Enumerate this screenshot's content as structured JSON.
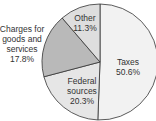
{
  "chart_data": {
    "type": "pie",
    "title": "",
    "categories": [
      "Taxes",
      "Federal sources",
      "Charges for goods and services",
      "Other"
    ],
    "values": [
      50.6,
      20.3,
      17.8,
      11.3
    ],
    "unit": "%",
    "colors": [
      "#f2f2f2",
      "#e6e6e6",
      "#b9b9b9",
      "#dedede"
    ],
    "labels": {
      "taxes": {
        "line1": "Taxes",
        "line2": "50.6%"
      },
      "federal": {
        "line1": "Federal",
        "line2": "sources",
        "line3": "20.3%"
      },
      "charges": {
        "line1": "Charges for",
        "line2": "goods and",
        "line3": "services",
        "line4": "17.8%"
      },
      "other": {
        "line1": "Other",
        "line2": "11.3%"
      }
    },
    "legend": "none (inline labels)",
    "start_angle": "12 o'clock, clockwise"
  }
}
